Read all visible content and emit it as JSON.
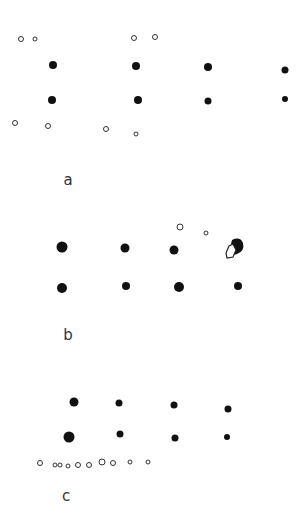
{
  "figure": {
    "panels": [
      {
        "label": "a",
        "label_pos": [
          68,
          180
        ],
        "filled": [
          [
            53,
            65,
            8
          ],
          [
            52,
            100,
            8
          ],
          [
            136,
            66,
            8
          ],
          [
            138,
            100,
            8
          ],
          [
            208,
            67,
            8
          ],
          [
            208,
            101,
            7
          ],
          [
            285,
            70,
            7
          ],
          [
            285,
            99,
            6
          ]
        ],
        "hollow": [
          [
            21,
            39,
            6
          ],
          [
            35,
            39,
            5
          ],
          [
            134,
            38,
            6
          ],
          [
            155,
            37,
            6
          ],
          [
            15,
            123,
            6
          ],
          [
            48,
            126,
            6
          ],
          [
            106,
            129,
            6
          ],
          [
            136,
            134,
            5
          ]
        ]
      },
      {
        "label": "b",
        "label_pos": [
          68,
          335
        ],
        "filled": [
          [
            62,
            247,
            11
          ],
          [
            125,
            248,
            9
          ],
          [
            174,
            250,
            9
          ],
          [
            62,
            288,
            10
          ],
          [
            126,
            286,
            8
          ],
          [
            179,
            287,
            10
          ],
          [
            238,
            286,
            8
          ]
        ],
        "hollow": [
          [
            180,
            227,
            7
          ],
          [
            206,
            233,
            5
          ]
        ],
        "blob": {
          "center": [
            236,
            247
          ]
        }
      },
      {
        "label": "c",
        "label_pos": [
          66,
          496
        ],
        "filled": [
          [
            74,
            402,
            9
          ],
          [
            119,
            403,
            7
          ],
          [
            174,
            405,
            7
          ],
          [
            228,
            409,
            7
          ],
          [
            69,
            437,
            11
          ],
          [
            120,
            434,
            7
          ],
          [
            175,
            438,
            7
          ],
          [
            227,
            437,
            6
          ]
        ],
        "hollow": [
          [
            40,
            463,
            6
          ],
          [
            55,
            465,
            5
          ],
          [
            60,
            465,
            5
          ],
          [
            68,
            466,
            5
          ],
          [
            78,
            465,
            6
          ],
          [
            89,
            465,
            6
          ],
          [
            102,
            462,
            7
          ],
          [
            113,
            463,
            6
          ],
          [
            130,
            462,
            5
          ],
          [
            148,
            462,
            5
          ]
        ]
      }
    ]
  }
}
